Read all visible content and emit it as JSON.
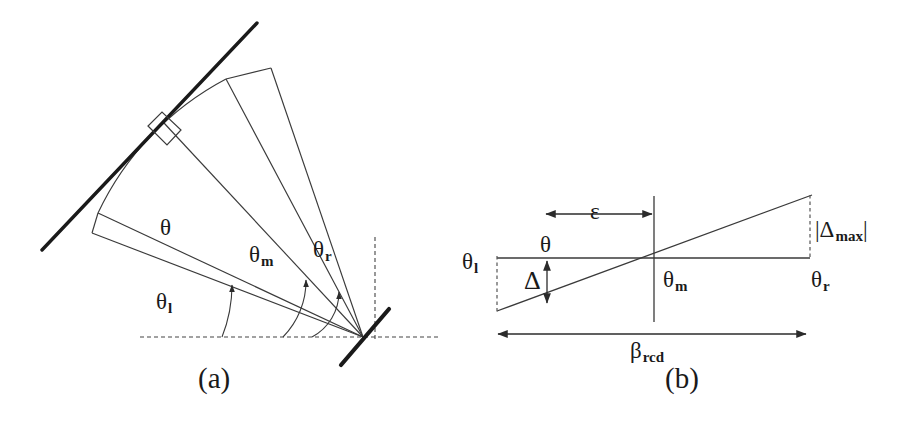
{
  "figure": {
    "kind": "two-panel-geometry-diagram",
    "background_color": "#ffffff",
    "line_color": "#2b2b2b",
    "text_color": "#1a1a1a",
    "width": 908,
    "height": 422
  },
  "panel_a": {
    "caption": "(a)",
    "description": "Angular sector fan with tangent line and right-angle marker",
    "labels": {
      "theta": "θ",
      "theta_l_base": "θ",
      "theta_l_sub": "l",
      "theta_m_base": "θ",
      "theta_m_sub": "m",
      "theta_r_base": "θ",
      "theta_r_sub": "r"
    },
    "geometry": {
      "vertex": [
        363,
        337
      ],
      "ray_angles_deg": [
        21,
        25,
        47,
        62
      ],
      "arc_radius": 292,
      "angle_arc_radii": [
        118,
        148,
        178
      ],
      "tangent_line": [
        [
          42,
          250
        ],
        [
          255,
          25
        ]
      ],
      "right_angle_marker_at": [
        163,
        136
      ],
      "dashed_horizontal_y": 337,
      "dashed_vertical_x": 375,
      "vertex_bar": [
        [
          340,
          363
        ],
        [
          388,
          310
        ]
      ]
    }
  },
  "panel_b": {
    "caption": "(b)",
    "description": "Linearized error plot: baseline, sloped error line, epsilon offset, delta and delta-max spans, beta_rcd total width",
    "labels": {
      "theta_l_base": "θ",
      "theta_l_sub": "l",
      "theta_m_base": "θ",
      "theta_m_sub": "m",
      "theta_r_base": "θ",
      "theta_r_sub": "r",
      "theta": "θ",
      "epsilon": "ε",
      "delta": "Δ",
      "delta_max_open": "|",
      "delta_max_base": "Δ",
      "delta_max_sub": "max",
      "delta_max_close": "|",
      "beta_base": "β",
      "beta_sub": "rcd"
    },
    "geometry": {
      "baseline": [
        [
          497,
          258
        ],
        [
          810,
          258
        ]
      ],
      "sloped_line": [
        [
          497,
          310
        ],
        [
          810,
          196
        ]
      ],
      "center_vertical": [
        [
          654,
          196
        ],
        [
          654,
          322
        ]
      ],
      "left_dashed_vertical": [
        [
          497,
          258
        ],
        [
          497,
          314
        ]
      ],
      "right_dashed_vertical": [
        [
          810,
          196
        ],
        [
          810,
          258
        ]
      ],
      "epsilon_arrow": {
        "y": 214,
        "x1": 544,
        "x2": 654
      },
      "delta_arrow": {
        "x": 547,
        "y1": 262,
        "y2": 302
      },
      "beta_arrow": {
        "y": 334,
        "x1": 497,
        "x2": 807
      }
    }
  }
}
